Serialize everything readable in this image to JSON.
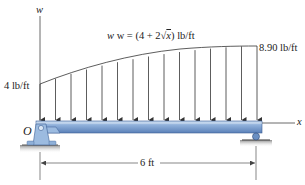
{
  "diagram": {
    "type": "distributed-load-beam",
    "axis_labels": {
      "vertical": "w",
      "horizontal": "x",
      "origin": "O"
    },
    "load_function": {
      "prefix": "w = (4 + 2",
      "radical": "√",
      "radicand": "x",
      "suffix": ") lb/ft"
    },
    "load_left_label": "4 lb/ft",
    "load_right_label": "8.90 lb/ft",
    "span_label": "6 ft",
    "arrow_count": 15,
    "supports": [
      {
        "position": "left",
        "type": "pin"
      },
      {
        "position": "right",
        "type": "roller"
      }
    ],
    "colors": {
      "beam_top": "#a8c4e6",
      "beam_bottom": "#5f86bf",
      "beam_edge": "#3d5f94",
      "support": "#8fb0d8",
      "ground": "#9a9a9a",
      "line": "#333333"
    }
  }
}
